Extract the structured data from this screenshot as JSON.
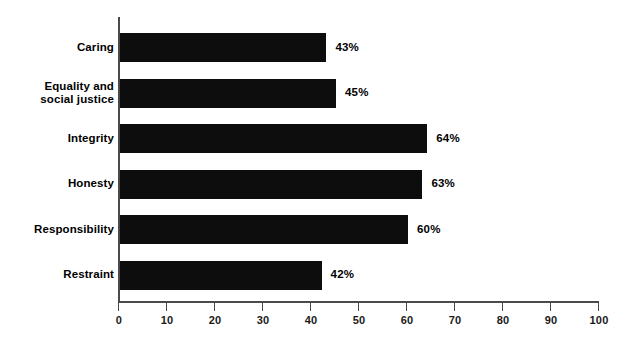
{
  "chart_data": {
    "type": "bar",
    "orientation": "horizontal",
    "title": "",
    "xlabel": "",
    "ylabel": "",
    "xlim": [
      0,
      100
    ],
    "grid": false,
    "legend": null,
    "value_suffix": "%",
    "categories": [
      "Caring",
      "Equality and\nsocial justice",
      "Integrity",
      "Honesty",
      "Responsibility",
      "Restraint"
    ],
    "values": [
      43,
      45,
      64,
      63,
      60,
      42
    ],
    "value_labels": [
      "43%",
      "45%",
      "64%",
      "63%",
      "60%",
      "42%"
    ],
    "tick_values": [
      0,
      10,
      20,
      30,
      40,
      50,
      60,
      70,
      80,
      90,
      100
    ],
    "tick_labels": [
      "0",
      "10",
      "20",
      "30",
      "40",
      "50",
      "60",
      "70",
      "80",
      "90",
      "100"
    ],
    "bar_color": "#0d0d0d",
    "axis_color": "#4a4a4a",
    "background_color": "#ffffff",
    "text_color": "#000000"
  }
}
